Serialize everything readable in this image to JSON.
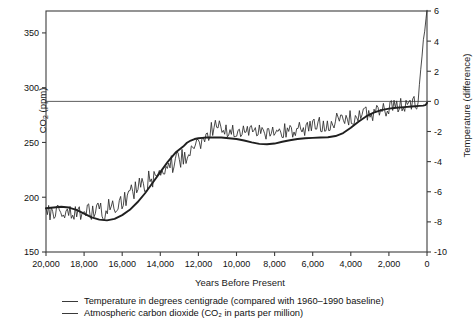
{
  "chart_data": {
    "type": "line",
    "title": "",
    "xlabel": "Years Before Present",
    "ylabel_left": "CO2 (ppm)",
    "ylabel_right": "Temperature (difference)",
    "xlim": [
      20000,
      0
    ],
    "x_reversed": true,
    "ylim_left": [
      150,
      370
    ],
    "ylim_right": [
      -10,
      6
    ],
    "grid": false,
    "legend_position": "below-axes",
    "xticks": [
      20000,
      18000,
      16000,
      14000,
      12000,
      10000,
      8000,
      6000,
      4000,
      2000,
      0
    ],
    "xticklabels": [
      "20,000",
      "18,000",
      "16,000",
      "14,000",
      "12,000",
      "10,000",
      "8,000",
      "6,000",
      "4,000",
      "2,000",
      "0"
    ],
    "yticks_left": [
      150,
      200,
      250,
      300,
      350
    ],
    "yticklabels_left": [
      "150",
      "200",
      "250",
      "300",
      "350"
    ],
    "yticks_right": [
      -10,
      -8,
      -6,
      -4,
      -2,
      0,
      2,
      4,
      6
    ],
    "yticklabels_right": [
      "-10",
      "-8",
      "-6",
      "-4",
      "-2",
      "0",
      "2",
      "4",
      "6"
    ],
    "reference_line": {
      "value_left_ppm": 288,
      "value_right_c": 0,
      "style": "solid-thin"
    },
    "series": [
      {
        "name": "Temperature in degrees centigrade (compared with 1960-1990 baseline)",
        "axis": "right",
        "style": "smooth-thick",
        "units": "degrees C difference",
        "x": [
          20000,
          19600,
          19200,
          18800,
          18400,
          18000,
          17600,
          17200,
          16800,
          16400,
          16000,
          15600,
          15200,
          14800,
          14400,
          14000,
          13600,
          13200,
          12800,
          12600,
          12400,
          12200,
          12000,
          11800,
          11600,
          11400,
          11200,
          11000,
          10800,
          10400,
          10000,
          9600,
          9200,
          8800,
          8400,
          8000,
          7600,
          7200,
          6800,
          6400,
          6000,
          5600,
          5200,
          4800,
          4400,
          4000,
          3600,
          3200,
          2800,
          2400,
          2000,
          1600,
          1200,
          800,
          400,
          200,
          100,
          50,
          0
        ],
        "y": [
          -7.1,
          -7.05,
          -7.0,
          -7.05,
          -7.2,
          -7.45,
          -7.7,
          -7.85,
          -7.9,
          -7.8,
          -7.55,
          -7.2,
          -6.7,
          -6.1,
          -5.4,
          -4.7,
          -4.0,
          -3.4,
          -3.0,
          -2.75,
          -2.6,
          -2.5,
          -2.45,
          -2.42,
          -2.4,
          -2.4,
          -2.4,
          -2.4,
          -2.4,
          -2.45,
          -2.5,
          -2.6,
          -2.72,
          -2.82,
          -2.85,
          -2.8,
          -2.68,
          -2.58,
          -2.5,
          -2.45,
          -2.42,
          -2.4,
          -2.38,
          -2.3,
          -2.1,
          -1.75,
          -1.35,
          -1.0,
          -0.75,
          -0.58,
          -0.48,
          -0.42,
          -0.38,
          -0.34,
          -0.3,
          -0.28,
          -0.25,
          -0.2,
          -0.1
        ]
      },
      {
        "name": "Atmospheric carbon dioxide (CO2 in parts per million)",
        "axis": "left",
        "style": "jagged-thin",
        "units": "ppm",
        "description": "High-frequency proxy record, rises from ~175 ppm at 20,000 BP to a sharp modern spike exceeding 370 ppm at 0 BP"
      }
    ],
    "annotations": []
  },
  "legend": {
    "items": [
      {
        "label": "Temperature in degrees centigrade (compared with 1960–1990 baseline)",
        "swatch": "line-dash"
      },
      {
        "label": "Atmospheric carbon dioxide (CO₂ in parts per million)",
        "swatch": "line-dash"
      }
    ]
  },
  "axes": {
    "left_label_main": "CO",
    "left_label_sub": "2",
    "left_label_tail": " (ppm)",
    "right_label": "Temperature (difference)",
    "x_label": "Years Before Present"
  },
  "colors": {
    "frame": "#3d3d3d",
    "temperature_line": "#1f1f1f",
    "co2_line": "#2b2b2b",
    "reference_line": "#4a4a4a",
    "text": "#111111",
    "background": "#ffffff"
  }
}
